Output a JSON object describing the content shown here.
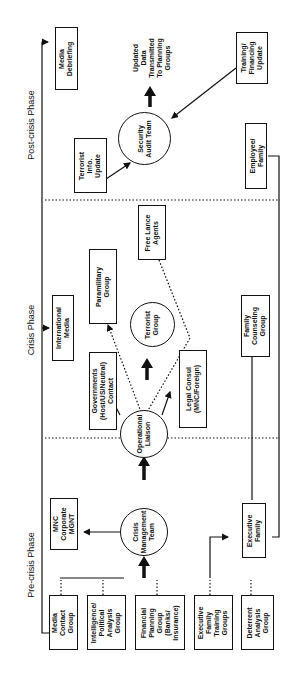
{
  "phases": {
    "pre_crisis": "Pre-crisis Phase",
    "crisis": "Crisis Phase",
    "post_crisis": "Post-crisis Phase"
  },
  "pre_crisis": {
    "groups": [
      "Media\nContact\nGroup",
      "Intelligence/\nPolitical\nAnalysis\nGroup",
      "Financial\nPlanning\nGroup\n(Banks/\nInsurance)",
      "Executive\nFamily\nTraining\nGroups",
      "Deterrent\nAnalysis\nGroup"
    ],
    "crisis_management_team": "Crisis\nManagement\nTeam",
    "mnc_corporate_mgnt": "MNC\nCorporate\nMGNT",
    "executive_family": "Executive\nFamily"
  },
  "crisis": {
    "international_media": "International\nMedia",
    "operational_liaison": "Operational\nLiaison",
    "governments_contact": "Governments\n(Host/US/Neutral)\nContact",
    "legal_consul": "Legal Consul\n(MNC/Foreign)",
    "terrorist_group": "Terrorist\nGroup",
    "paramilitary_group": "Paramilitary\nGroup",
    "free_lance_agents": "Free Lance\nAgents",
    "family_counseling_group": "Family\nCounseling\nGroup"
  },
  "post_crisis": {
    "media_debriefing": "Media\nDebriefing",
    "terrorist_info_update": "Terrorist\nInfo.\nUpdate",
    "security_audit_team": "Security\nAudit Team",
    "updated_data_note": "Updated\nData\nTransmitted\nTo Planning\nGroups",
    "training_financing_update": "Training/\nFinancing\nUpdate",
    "employee_family": "Employee/\nFamily"
  }
}
